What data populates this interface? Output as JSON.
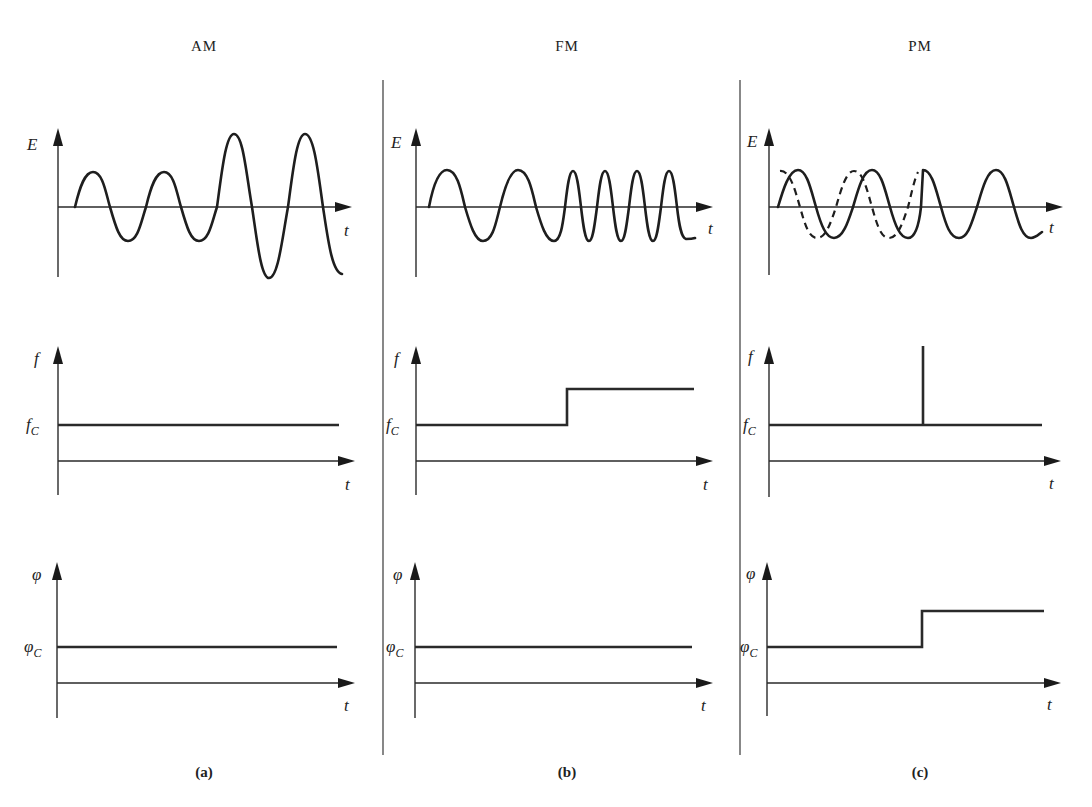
{
  "figure": {
    "columns": [
      {
        "key": "am",
        "title": "AM",
        "caption": "(a)",
        "rows": {
          "waveform": {
            "ylabel": "E",
            "xlabel": "t",
            "description": "Amplitude varies: two small-amplitude cycles then two large-amplitude cycles; frequency constant"
          },
          "frequency": {
            "ylabel": "f",
            "level_label": "f",
            "level_sub": "C",
            "xlabel": "t",
            "description": "Constant at carrier frequency fC"
          },
          "phase": {
            "ylabel": "φ",
            "level_label": "φ",
            "level_sub": "C",
            "xlabel": "t",
            "description": "Constant at carrier phase φC"
          }
        }
      },
      {
        "key": "fm",
        "title": "FM",
        "caption": "(b)",
        "rows": {
          "waveform": {
            "ylabel": "E",
            "xlabel": "t",
            "description": "Constant amplitude; two low-frequency cycles then four high-frequency cycles"
          },
          "frequency": {
            "ylabel": "f",
            "level_label": "f",
            "level_sub": "C",
            "xlabel": "t",
            "description": "Step increase from fC midway"
          },
          "phase": {
            "ylabel": "φ",
            "level_label": "φ",
            "level_sub": "C",
            "xlabel": "t",
            "description": "Constant at φC"
          }
        }
      },
      {
        "key": "pm",
        "title": "PM",
        "caption": "(c)",
        "rows": {
          "waveform": {
            "ylabel": "E",
            "xlabel": "t",
            "description": "Solid carrier with dashed phase-advanced reference; abrupt phase jump midway"
          },
          "frequency": {
            "ylabel": "f",
            "level_label": "f",
            "level_sub": "C",
            "xlabel": "t",
            "description": "Constant at fC with an impulse spike at the phase-jump instant"
          },
          "phase": {
            "ylabel": "φ",
            "level_label": "φ",
            "level_sub": "C",
            "xlabel": "t",
            "description": "Step increase from φC midway"
          }
        }
      }
    ]
  }
}
